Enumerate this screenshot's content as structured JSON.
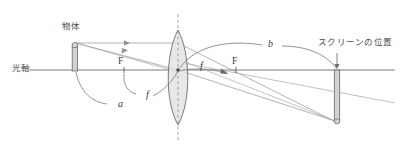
{
  "figure": {
    "title_alt": "凸レンズによる実像の作図",
    "type": "optics-ray-diagram"
  },
  "labels": {
    "optical_axis": "光軸",
    "object": "物体",
    "screen_position": "スクリーンの位置",
    "focal_point_left": "F",
    "focal_point_right": "F",
    "focal_length_left": "f",
    "focal_length_right": "f",
    "distance_object": "a",
    "distance_image": "b"
  },
  "colors": {
    "axis": "#6e6e6e",
    "ray": "#8c8c8c",
    "lens_fill": "#e2e2e2",
    "lens_stroke": "#666666",
    "dashed_center": "#8f8f8f",
    "object_fill": "#cfcfcf",
    "object_stroke": "#6a6a6a",
    "text": "#3c3c3c",
    "leader": "#707070",
    "background": "#ffffff"
  },
  "geometry": {
    "optical_axis_y": 70,
    "lens_center_x": 178,
    "lens_top_y": 30,
    "lens_bottom_y": 125,
    "lens_half_width": 14,
    "object_x": 75,
    "object_top_y": 42,
    "object_bottom_y": 71,
    "image_x": 337,
    "image_top_y": 70,
    "image_bottom_y": 124,
    "focus_left_x": 124,
    "focus_right_x": 236,
    "axis_left_x": 30,
    "axis_right_x": 395
  }
}
